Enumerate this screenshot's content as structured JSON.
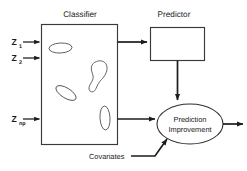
{
  "figure": {
    "width": 247,
    "height": 171,
    "background_color": "#ffffff",
    "line_color": "#1c1c1c",
    "shape_stroke_color": "#4a4a4a",
    "text_color": "#1a1a1a"
  },
  "titles": {
    "classifier": "Classifier",
    "predictor": "Predictor"
  },
  "inputs": [
    {
      "base": "Z",
      "subscript": "1",
      "full": "Z1"
    },
    {
      "base": "Z",
      "subscript": "2",
      "full": "Z2"
    },
    {
      "base": "Z",
      "subscript": "np",
      "full": "Znp"
    }
  ],
  "nodes": {
    "classifier_box": {
      "label": "",
      "shape": "rectangle"
    },
    "predictor_box": {
      "label": "",
      "shape": "rectangle"
    },
    "outcome_ellipse": {
      "shape": "ellipse",
      "line1": "Prediction",
      "line2": "Improvement"
    }
  },
  "annotations": {
    "covariates": "Covariates"
  },
  "edges": [
    {
      "from": "Z1",
      "to": "classifier_box",
      "type": "arrow"
    },
    {
      "from": "Z2",
      "to": "classifier_box",
      "type": "arrow"
    },
    {
      "from": "Znp",
      "to": "classifier_box",
      "type": "arrow"
    },
    {
      "from": "classifier_box",
      "to": "predictor_box",
      "type": "arrow"
    },
    {
      "from": "predictor_box",
      "to": "outcome_ellipse",
      "type": "arrow"
    },
    {
      "from": "classifier_box",
      "to": "outcome_ellipse",
      "type": "arrow"
    },
    {
      "from": "covariates",
      "to": "outcome_ellipse",
      "type": "arrow"
    },
    {
      "from": "outcome_ellipse",
      "to": "output",
      "type": "arrow"
    }
  ],
  "classifier_regions": [
    {
      "name": "region-upper-left",
      "shape": "ellipse-horizontal"
    },
    {
      "name": "region-upper-right",
      "shape": "blob-irregular"
    },
    {
      "name": "region-mid-left",
      "shape": "ellipse-tilted"
    },
    {
      "name": "region-lower-right",
      "shape": "ellipse-vertical"
    }
  ]
}
